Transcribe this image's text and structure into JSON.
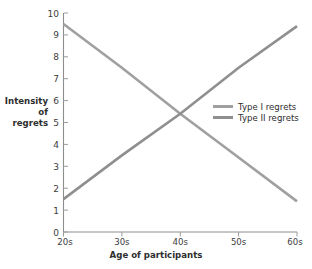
{
  "chart_data": {
    "type": "line",
    "title": "",
    "xlabel": "Age of participants",
    "ylabel": "Intensity of regrets",
    "ylabel_lines": [
      "Intensity",
      "of",
      "regrets"
    ],
    "categories": [
      "20s",
      "30s",
      "40s",
      "50s",
      "60s"
    ],
    "x_tick_labels": [
      "20s",
      "30s",
      "40s",
      "50s",
      "60s"
    ],
    "y_tick_labels": [
      "0",
      "1",
      "2",
      "3",
      "4",
      "5",
      "6",
      "7",
      "8",
      "9",
      "10"
    ],
    "ylim": [
      0,
      10
    ],
    "grid": false,
    "legend_position": "center-right",
    "crossing_point": {
      "x": "40s",
      "y": 5.4
    },
    "series": [
      {
        "name": "Type I regrets",
        "color": "#a0a0a0",
        "values": [
          9.5,
          7.5,
          5.4,
          3.4,
          1.4
        ]
      },
      {
        "name": "Type II regrets",
        "color": "#8f8f8f",
        "values": [
          1.5,
          3.5,
          5.4,
          7.5,
          9.4
        ]
      }
    ]
  },
  "axes": {
    "axis_color": "#8e8e8e"
  }
}
